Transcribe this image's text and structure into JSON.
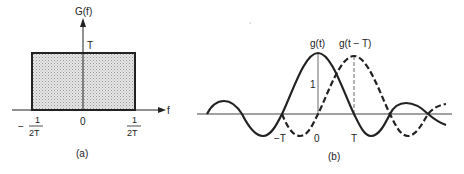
{
  "panel_a": {
    "caption": "(a)",
    "y_axis_label": "G(f)",
    "x_axis_label": "f",
    "height_label": "T",
    "origin_label": "0",
    "left_edge": {
      "sign": "−",
      "numerator": "1",
      "denominator": "2T"
    },
    "right_edge": {
      "numerator": "1",
      "denominator": "2T"
    },
    "colors": {
      "fill": "#d9d9d9",
      "stroke": "#222222"
    }
  },
  "panel_b": {
    "caption": "(b)",
    "curve_solid_label": "g(t)",
    "curve_dashed_label": "g(t − T)",
    "amplitude_label": "1",
    "tick_labels": [
      "−T",
      "0",
      "T"
    ],
    "colors": {
      "stroke": "#222222"
    }
  }
}
